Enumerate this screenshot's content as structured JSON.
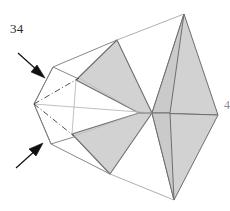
{
  "figure": {
    "number_label": "34",
    "edge_clipped_label": "4",
    "type": "origami-crease-pattern",
    "canvas": {
      "width": 230,
      "height": 211
    },
    "colors": {
      "fill_shaded": "#d2d2d2",
      "stroke_shaded": "#6e6e6e",
      "stroke_outline": "#7a7a7a",
      "stroke_thin": "#a8a8a8",
      "crease_dashed": "#4a4a4a",
      "arrow": "#101010",
      "background": "#ffffff",
      "text": "#2b2b2b"
    },
    "vertices": {
      "left_apex": [
        34,
        104
      ],
      "kite_top": [
        53,
        67
      ],
      "kite_bottom": [
        51,
        144
      ],
      "center_junction": [
        152,
        113
      ],
      "inner_left_node": [
        76,
        80
      ],
      "inner_left_node_lower": [
        72,
        134
      ],
      "mid_node": [
        139,
        113
      ],
      "upper_flap_apex": [
        117,
        40
      ],
      "lower_flap_apex": [
        110,
        174
      ],
      "right_upper_apex": [
        184,
        14
      ],
      "right_lower_apex": [
        174,
        200
      ],
      "far_right": [
        218,
        115
      ]
    },
    "shaded_flaps": [
      {
        "name": "upper-left-shaded-flap",
        "points": "117,40 152,113 139,113 76,80"
      },
      {
        "name": "lower-left-shaded-flap",
        "points": "110,174 152,113 139,113 72,134"
      },
      {
        "name": "upper-right-shaded-flap",
        "points": "184,14 152,113 173,113"
      },
      {
        "name": "lower-right-shaded-flap",
        "points": "174,200 152,113 173,113"
      },
      {
        "name": "right-upper-wing",
        "points": "184,14 218,115 152,113"
      },
      {
        "name": "right-lower-wing",
        "points": "174,200 218,115 152,113"
      }
    ],
    "crease_lines": [
      {
        "name": "crease-upper-valley",
        "style": "dash-dot",
        "from": [
          34,
          104
        ],
        "to": [
          76,
          80
        ]
      },
      {
        "name": "crease-lower-valley",
        "style": "dash-dot",
        "from": [
          34,
          104
        ],
        "to": [
          72,
          134
        ]
      },
      {
        "name": "crease-center-axis",
        "style": "solid-thin",
        "from": [
          34,
          104
        ],
        "to": [
          139,
          113
        ]
      },
      {
        "name": "crease-vertical-kite",
        "style": "solid-thin",
        "from": [
          76,
          80
        ],
        "to": [
          72,
          134
        ]
      }
    ],
    "arrows": [
      {
        "name": "fold-arrow-upper",
        "direction": "down-right",
        "from": [
          18,
          53
        ],
        "to": [
          44,
          76
        ]
      },
      {
        "name": "fold-arrow-lower",
        "direction": "up-right",
        "from": [
          16,
          168
        ],
        "to": [
          42,
          144
        ]
      }
    ]
  }
}
